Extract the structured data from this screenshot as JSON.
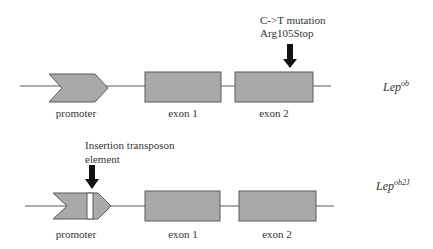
{
  "colors": {
    "box_fill": "#a9a9a9",
    "box_stroke": "#5a5a5a",
    "line": "#5a5a5a",
    "arrow": "#111111",
    "insertion": "#ffffff"
  },
  "constructs": [
    {
      "name": "Lep-ob",
      "gene_label": {
        "base": "Lep",
        "superscript": "ob"
      },
      "annotation": {
        "line1": "C->T mutation",
        "line2": "Arg105Stop",
        "target": "exon 2"
      },
      "labels": {
        "promoter": "promoter",
        "exon1": "exon 1",
        "exon2": "exon 2"
      }
    },
    {
      "name": "Lep-ob2J",
      "gene_label": {
        "base": "Lep",
        "superscript": "ob2J"
      },
      "annotation": {
        "line1": "Insertion transposon",
        "line2": "element",
        "target": "promoter"
      },
      "labels": {
        "promoter": "promoter",
        "exon1": "exon 1",
        "exon2": "exon 2"
      }
    }
  ]
}
